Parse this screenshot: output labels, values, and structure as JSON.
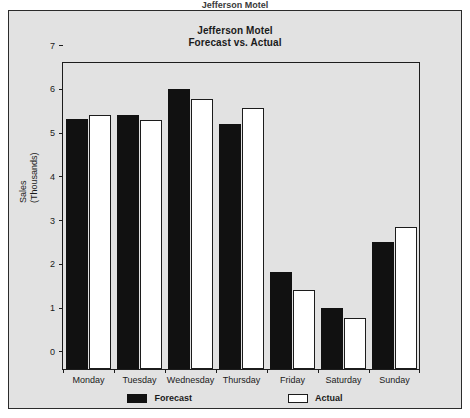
{
  "top_caption": "Jefferson Motel",
  "chart_data": {
    "type": "bar",
    "title": "Jefferson Motel",
    "subtitle": "Forecast vs. Actual",
    "xlabel": "",
    "ylabel": "Sales",
    "ylabel_line2": "(Thousands)",
    "ylim": [
      0,
      7
    ],
    "yticks": [
      0,
      1,
      2,
      3,
      4,
      5,
      6,
      7
    ],
    "ytick_labels": [
      "0",
      "1",
      "2",
      "3",
      "4",
      "5",
      "6",
      "7"
    ],
    "grid": false,
    "legend_position": "bottom",
    "categories": [
      "Monday",
      "Tuesday",
      "Wednesday",
      "Thursday",
      "Friday",
      "Saturday",
      "Sunday"
    ],
    "series": [
      {
        "name": "Forecast",
        "color": "#111111",
        "values": [
          5.72,
          5.81,
          6.41,
          5.61,
          2.22,
          1.4,
          2.91
        ]
      },
      {
        "name": "Actual",
        "color": "#ffffff",
        "values": [
          5.8,
          5.7,
          6.18,
          5.97,
          1.81,
          1.17,
          3.25
        ]
      }
    ]
  },
  "colors": {
    "figure_background": "#e2e2e2",
    "frame": "#2b2b2b",
    "axis": "#1c1c1c",
    "text": "#1a1a1a",
    "forecast": "#111111",
    "actual": "#ffffff"
  }
}
